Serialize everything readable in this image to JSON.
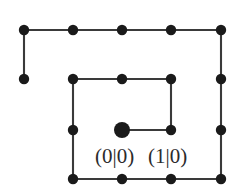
{
  "figure": {
    "type": "lattice-path-diagram",
    "background_color": "#ffffff",
    "node_color": "#1a1a1a",
    "edge_color": "#3a3a3a",
    "grid": {
      "columns_x": [
        24,
        73,
        122,
        171,
        221
      ],
      "rows_y": [
        30,
        79,
        130,
        179
      ],
      "spacing_x": 49,
      "spacing_y": 49
    },
    "nodes": [
      {
        "name": "node-top-c0",
        "x": 24,
        "y": 30,
        "r": 5.2,
        "kind": "normal"
      },
      {
        "name": "node-top-c1",
        "x": 73,
        "y": 30,
        "r": 5.2,
        "kind": "normal"
      },
      {
        "name": "node-top-c2",
        "x": 122,
        "y": 30,
        "r": 5.2,
        "kind": "normal"
      },
      {
        "name": "node-top-c3",
        "x": 171,
        "y": 30,
        "r": 5.2,
        "kind": "normal"
      },
      {
        "name": "node-top-c4",
        "x": 221,
        "y": 30,
        "r": 5.2,
        "kind": "normal"
      },
      {
        "name": "node-left-tail",
        "x": 24,
        "y": 79,
        "r": 5.2,
        "kind": "normal"
      },
      {
        "name": "node-r2-c1",
        "x": 73,
        "y": 79,
        "r": 5.2,
        "kind": "normal"
      },
      {
        "name": "node-r2-c2",
        "x": 122,
        "y": 79,
        "r": 5.2,
        "kind": "normal"
      },
      {
        "name": "node-r2-c3",
        "x": 171,
        "y": 79,
        "r": 5.2,
        "kind": "normal"
      },
      {
        "name": "node-r2-c4",
        "x": 221,
        "y": 79,
        "r": 5.2,
        "kind": "normal"
      },
      {
        "name": "node-r3-c1",
        "x": 73,
        "y": 130,
        "r": 5.2,
        "kind": "normal"
      },
      {
        "name": "node-origin",
        "x": 122,
        "y": 130,
        "r": 8.0,
        "kind": "origin"
      },
      {
        "name": "node-r3-c3",
        "x": 171,
        "y": 130,
        "r": 5.2,
        "kind": "normal"
      },
      {
        "name": "node-r3-c4",
        "x": 221,
        "y": 130,
        "r": 5.2,
        "kind": "normal"
      },
      {
        "name": "node-bot-c1",
        "x": 73,
        "y": 179,
        "r": 5.2,
        "kind": "normal"
      },
      {
        "name": "node-bot-c2",
        "x": 122,
        "y": 179,
        "r": 5.2,
        "kind": "normal"
      },
      {
        "name": "node-bot-c3",
        "x": 171,
        "y": 179,
        "r": 5.2,
        "kind": "normal"
      },
      {
        "name": "node-bot-c4",
        "x": 221,
        "y": 179,
        "r": 5.2,
        "kind": "normal"
      }
    ],
    "edges": [
      {
        "name": "edge-top-row",
        "x1": 24,
        "y1": 30,
        "x2": 221,
        "y2": 30
      },
      {
        "name": "edge-left-down",
        "x1": 24,
        "y1": 30,
        "x2": 24,
        "y2": 79
      },
      {
        "name": "edge-right-down",
        "x1": 221,
        "y1": 30,
        "x2": 221,
        "y2": 179
      },
      {
        "name": "edge-inner-top-row",
        "x1": 73,
        "y1": 79,
        "x2": 171,
        "y2": 79
      },
      {
        "name": "edge-inner-right-down",
        "x1": 171,
        "y1": 79,
        "x2": 171,
        "y2": 130
      },
      {
        "name": "edge-origin-right",
        "x1": 122,
        "y1": 130,
        "x2": 171,
        "y2": 130
      },
      {
        "name": "edge-inner-left-down",
        "x1": 73,
        "y1": 79,
        "x2": 73,
        "y2": 179
      },
      {
        "name": "edge-bottom-row",
        "x1": 73,
        "y1": 179,
        "x2": 221,
        "y2": 179
      }
    ],
    "labels": [
      {
        "name": "label-origin-coordinate",
        "text": "(0|0)",
        "x": 95,
        "y": 146
      },
      {
        "name": "label-step-coordinate",
        "text": "(1|0)",
        "x": 148,
        "y": 146
      }
    ]
  }
}
